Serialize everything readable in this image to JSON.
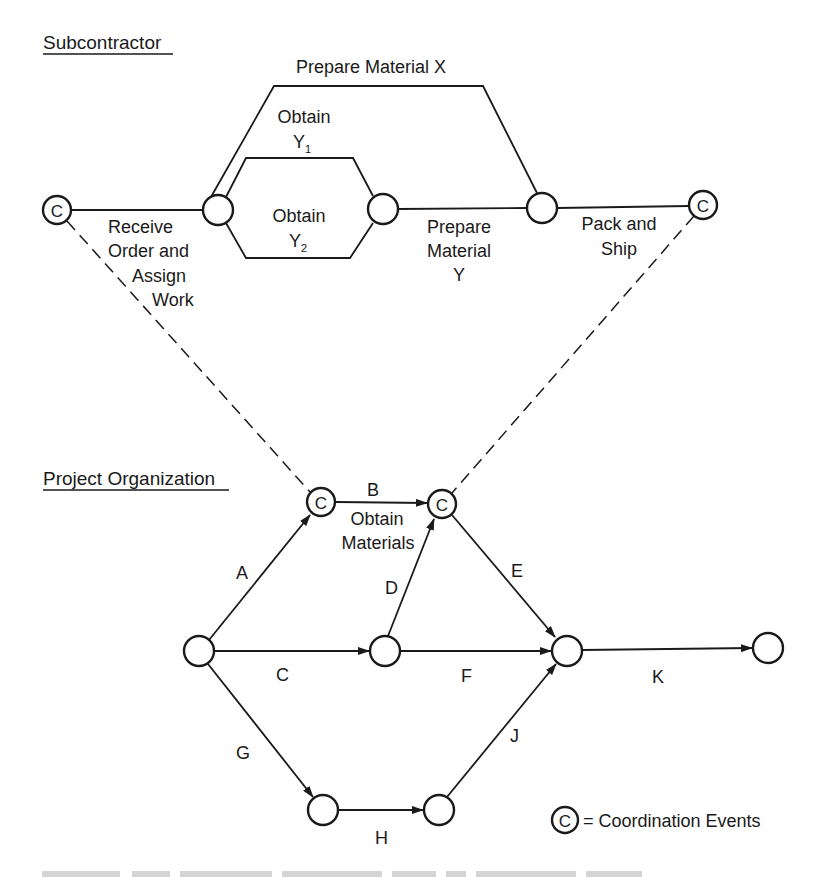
{
  "sections": {
    "subcontractor": "Subcontractor",
    "project": "Project Organization"
  },
  "coordination_symbol": "C",
  "subcontractor_activities": {
    "receive": [
      "Receive",
      "Order and",
      "Assign",
      "Work"
    ],
    "prepare_x": "Prepare Material X",
    "obtain_y1": [
      "Obtain",
      "Y",
      "1"
    ],
    "obtain_y2": [
      "Obtain",
      "Y",
      "2"
    ],
    "prepare_y": [
      "Prepare",
      "Material",
      "Y"
    ],
    "pack_ship": [
      "Pack and",
      "Ship"
    ]
  },
  "project_activities": {
    "A": "A",
    "B": "B",
    "B_desc": [
      "Obtain",
      "Materials"
    ],
    "C": "C",
    "D": "D",
    "E": "E",
    "F": "F",
    "G": "G",
    "H": "H",
    "J": "J",
    "K": "K"
  },
  "legend": {
    "symbol": "C",
    "text": "= Coordination Events"
  },
  "colors": {
    "ink": "#1a1a1a",
    "background": "#ffffff"
  }
}
